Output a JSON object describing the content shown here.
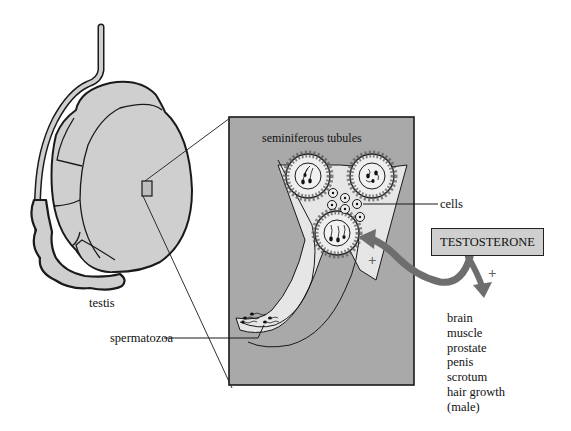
{
  "diagram": {
    "labels": {
      "testis": "testis",
      "seminiferous_tubules": "seminiferous tubules",
      "cells": "cells",
      "spermatozoa": "spermatozoa",
      "hormone": "TESTOSTERONE",
      "plus_sign_tubule": "+",
      "plus_sign_targets": "+"
    },
    "target_organs": [
      "brain",
      "muscle",
      "prostate",
      "penis",
      "scrotum",
      "hair growth",
      "(male)"
    ],
    "colors": {
      "tissue_fill": "#cfcfcf",
      "panel_fill": "#a9a9a9",
      "tubule_fill": "#e6e6e6",
      "arrow": "#6e6e6e",
      "outline": "#1a1a1a"
    }
  }
}
